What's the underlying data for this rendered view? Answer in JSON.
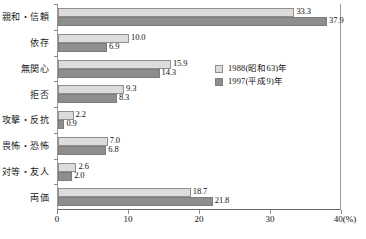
{
  "chart_data": {
    "type": "bar",
    "orientation": "horizontal",
    "title": "",
    "xlabel": "(%)",
    "ylabel": "",
    "xlim": [
      0,
      40
    ],
    "xticks": [
      "0",
      "10",
      "20",
      "30",
      "40"
    ],
    "xtick_values": [
      0,
      10,
      20,
      30,
      40
    ],
    "unit_label": "(%)",
    "grid": false,
    "legend_position": "inside-right",
    "categories": [
      "親和・信頼",
      "依存",
      "無関心",
      "拒否",
      "攻撃・反抗",
      "畏怖・恐怖",
      "対等・友人",
      "両価"
    ],
    "series": [
      {
        "name": "1988(昭和63)年",
        "color": "#dcdcdc",
        "values": [
          33.3,
          10.0,
          15.9,
          9.3,
          2.2,
          7.0,
          2.6,
          18.7
        ],
        "labels": [
          "33.3",
          "10.0",
          "15.9",
          "9.3",
          "2.2",
          "7.0",
          "2.6",
          "18.7"
        ]
      },
      {
        "name": "1997(平成9)年",
        "color": "#8e8e8e",
        "values": [
          37.9,
          6.9,
          14.3,
          8.3,
          0.9,
          6.8,
          2.0,
          21.8
        ],
        "labels": [
          "37.9",
          "6.9",
          "14.3",
          "8.3",
          "0.9",
          "6.8",
          "2.0",
          "21.8"
        ]
      }
    ]
  },
  "legend": {
    "items": [
      {
        "label": "1988(昭和63)年"
      },
      {
        "label": "1997(平成9)年"
      }
    ]
  }
}
